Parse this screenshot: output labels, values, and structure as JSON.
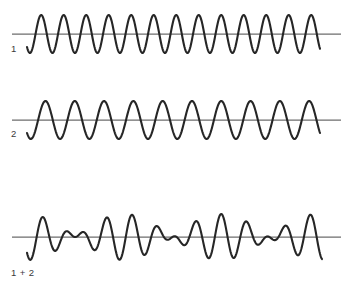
{
  "figure": {
    "type": "wave-superposition-diagram",
    "background_color": "#ffffff",
    "stroke_color": "#262626",
    "axis_color": "#6d6d6d",
    "label_color": "#3a3a3a"
  },
  "traces": [
    {
      "id": "wave-1",
      "label": "1",
      "label_x": 11,
      "label_y": 44,
      "baseline_y": 34,
      "axis_x_start": 12,
      "axis_x_end": 341,
      "wave_x_start": 27,
      "wave_x_end": 320,
      "period": 22.5,
      "amplitude": 19,
      "phase": 0.62,
      "cycles": 13
    },
    {
      "id": "wave-2",
      "label": "2",
      "label_x": 11,
      "label_y": 129,
      "baseline_y": 120,
      "axis_x_start": 12,
      "axis_x_end": 341,
      "wave_x_start": 27,
      "wave_x_end": 320,
      "period": 29.3,
      "amplitude": 19,
      "phase": 0.62,
      "cycles": 10
    },
    {
      "id": "wave-sum",
      "label": "1 + 2",
      "label_x": 11,
      "label_y": 268,
      "baseline_y": 237,
      "axis_x_start": 12,
      "axis_x_end": 341,
      "wave_x_start": 27,
      "wave_x_end": 322,
      "period": 22.5,
      "period_2": 29.3,
      "amplitude": 23,
      "phase": 0.62,
      "beat_nodes": 3
    }
  ],
  "chart_data": {
    "type": "line",
    "title": "",
    "xlabel": "",
    "ylabel": "",
    "grid": false,
    "legend": "none",
    "series": [
      {
        "name": "1",
        "waveform": "sine",
        "period_px": 22.5,
        "amplitude_px": 19,
        "cycles": 13,
        "baseline_y": 34
      },
      {
        "name": "2",
        "waveform": "sine",
        "period_px": 29.3,
        "amplitude_px": 19,
        "cycles": 10,
        "baseline_y": 120
      },
      {
        "name": "1 + 2",
        "waveform": "sum-of-sines",
        "component_periods_px": [
          22.5,
          29.3
        ],
        "amplitude_px": 23,
        "beat_nodes": 3,
        "baseline_y": 237
      }
    ]
  }
}
